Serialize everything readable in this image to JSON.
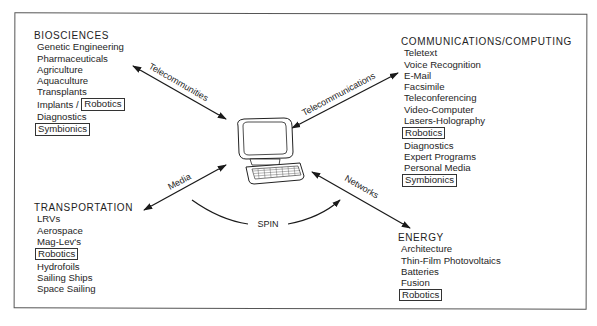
{
  "groups": {
    "biosciences": {
      "title": "BIOSCIENCES",
      "items": [
        {
          "label": "Genetic Engineering"
        },
        {
          "label": "Pharmaceuticals"
        },
        {
          "label": "Agriculture"
        },
        {
          "label": "Aquaculture"
        },
        {
          "label": "Transplants"
        },
        {
          "label": "Implants /",
          "boxed_suffix": "Robotics"
        },
        {
          "label": "Diagnostics"
        },
        {
          "label": "Symbionics",
          "boxed": true
        }
      ]
    },
    "communications": {
      "title": "COMMUNICATIONS/COMPUTING",
      "items": [
        {
          "label": "Teletext"
        },
        {
          "label": "Voice Recognition"
        },
        {
          "label": "E-Mail"
        },
        {
          "label": "Facsimile"
        },
        {
          "label": "Teleconferencing"
        },
        {
          "label": "Video-Computer"
        },
        {
          "label": "Lasers-Holography"
        },
        {
          "label": "Robotics",
          "boxed": true
        },
        {
          "label": "Diagnostics"
        },
        {
          "label": "Expert Programs"
        },
        {
          "label": "Personal Media"
        },
        {
          "label": "Symbionics",
          "boxed": true
        }
      ]
    },
    "transportation": {
      "title": "TRANSPORTATION",
      "items": [
        {
          "label": "LRVs"
        },
        {
          "label": "Aerospace"
        },
        {
          "label": "Mag-Lev's"
        },
        {
          "label": "Robotics",
          "boxed": true
        },
        {
          "label": "Hydrofoils"
        },
        {
          "label": "Sailing Ships"
        },
        {
          "label": "Space Sailing"
        }
      ]
    },
    "energy": {
      "title": "ENERGY",
      "items": [
        {
          "label": "Architecture"
        },
        {
          "label": "Thin-Film Photovoltaics"
        },
        {
          "label": "Batteries"
        },
        {
          "label": "Fusion"
        },
        {
          "label": "Robotics",
          "boxed": true
        }
      ]
    }
  },
  "connectors": {
    "biosciences": "Telecommunities",
    "communications": "Telecommunications",
    "transportation": "Media",
    "energy": "Networks"
  },
  "center": {
    "icon": "computer-terminal-icon",
    "cycle_label": "SPIN"
  }
}
